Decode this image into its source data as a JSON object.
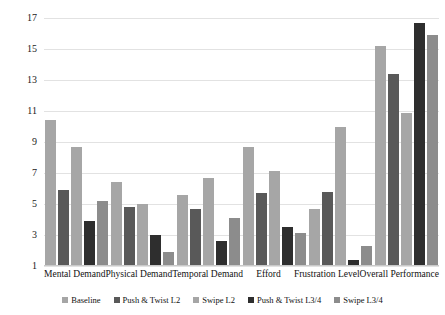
{
  "chart_data": {
    "type": "bar",
    "title": "",
    "subtitle": "",
    "xlabel": "",
    "ylabel": "",
    "ylim": [
      1,
      17
    ],
    "yticks": [
      1,
      3,
      5,
      7,
      9,
      11,
      13,
      15,
      17
    ],
    "grid": true,
    "legend_position": "bottom",
    "categories": [
      "Mental Demand",
      "Physical Demand",
      "Temporal Demand",
      "Efford",
      "Frustration Level",
      "Overall Performance"
    ],
    "series": [
      {
        "name": "Baseline",
        "color": "#a6a6a6",
        "values": [
          10.4,
          6.4,
          5.6,
          8.7,
          4.7,
          15.2
        ]
      },
      {
        "name": "Push & Twist L2",
        "color": "#595959",
        "values": [
          5.9,
          4.8,
          4.7,
          5.7,
          5.8,
          13.4
        ]
      },
      {
        "name": "Swipe L2",
        "color": "#a6a6a6",
        "values": [
          8.7,
          5.0,
          6.7,
          7.1,
          10.0,
          10.9
        ]
      },
      {
        "name": "Push & Twist L3/4",
        "color": "#2e2e2e",
        "values": [
          3.9,
          3.0,
          2.6,
          3.5,
          1.4,
          16.7
        ]
      },
      {
        "name": "Swipe L3/4",
        "color": "#8c8c8c",
        "values": [
          5.2,
          1.9,
          4.1,
          3.1,
          2.3,
          15.9
        ]
      }
    ]
  },
  "axis": {
    "ytick_labels": [
      "1",
      "3",
      "5",
      "7",
      "9",
      "11",
      "13",
      "15",
      "17"
    ]
  },
  "legend": {
    "items": [
      {
        "label": "Baseline",
        "color": "#a6a6a6"
      },
      {
        "label": "Push & Twist L2",
        "color": "#595959"
      },
      {
        "label": "Swipe L2",
        "color": "#a6a6a6"
      },
      {
        "label": "Push & Twist L3/4",
        "color": "#2e2e2e"
      },
      {
        "label": "Swipe L3/4",
        "color": "#8c8c8c"
      }
    ]
  },
  "colors": {
    "gridline": "#e2e2e2",
    "axis": "#c9c9c9",
    "background": "#ffffff",
    "text": "#111111"
  }
}
